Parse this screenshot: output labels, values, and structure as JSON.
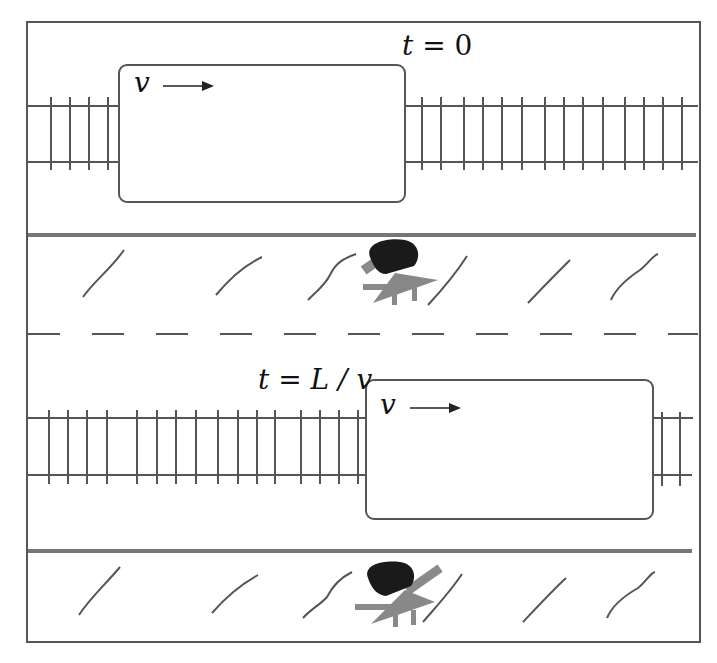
{
  "figure": {
    "panels": [
      {
        "id": "top",
        "time_label": "t = 0",
        "time_label_parts": {
          "var": "t",
          "eq": "=",
          "value": "0"
        },
        "train": {
          "velocity_label": "v",
          "arrow": "right-arrow"
        },
        "observer": "person-on-platform"
      },
      {
        "id": "bottom",
        "time_label": "t = L / v",
        "time_label_parts": {
          "var": "t",
          "eq": "=",
          "value": "L / v"
        },
        "train": {
          "velocity_label": "v",
          "arrow": "right-arrow"
        },
        "observer": "person-on-platform"
      }
    ],
    "colors": {
      "line": "#555555",
      "platform_edge": "#777777",
      "observer_head": "#1a1a1a",
      "observer_body": "#8a8a8a",
      "background": "#ffffff"
    }
  }
}
